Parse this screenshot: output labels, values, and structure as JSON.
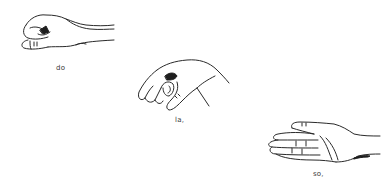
{
  "figures": [
    {
      "id": "do",
      "label": "do",
      "description": "closed fist, thumb tucked beneath"
    },
    {
      "id": "la",
      "label": "la,",
      "description": "hand drooping, fingers curled downward"
    },
    {
      "id": "so",
      "label": "so,",
      "description": "flat open hand, palm facing toward body"
    }
  ],
  "colors": {
    "ink": "#2a2a2a",
    "background": "#ffffff"
  }
}
